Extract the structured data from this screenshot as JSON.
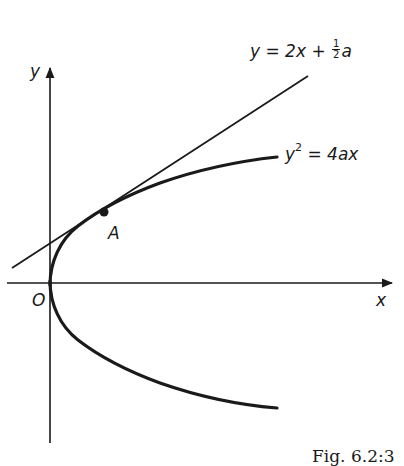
{
  "diagram": {
    "type": "coordinate-geometry-figure",
    "axes": {
      "x_label": "x",
      "y_label": "y",
      "origin_label": "O"
    },
    "curves": [
      {
        "id": "parabola",
        "label_lhs": "y",
        "label_exp": "2",
        "label_rhs": " = 4ax",
        "equation": "y^2 = 4ax"
      },
      {
        "id": "tangent",
        "label_main": "y = 2x + ",
        "label_frac_num": "1",
        "label_frac_den": "2",
        "label_tail": "a",
        "equation": "y = 2x + (1/2)a"
      }
    ],
    "points": [
      {
        "id": "A",
        "label": "A",
        "description": "point of tangency"
      }
    ],
    "caption": "Fig. 6.2:3"
  },
  "colors": {
    "ink": "#1a1a1a",
    "background": "#ffffff"
  }
}
